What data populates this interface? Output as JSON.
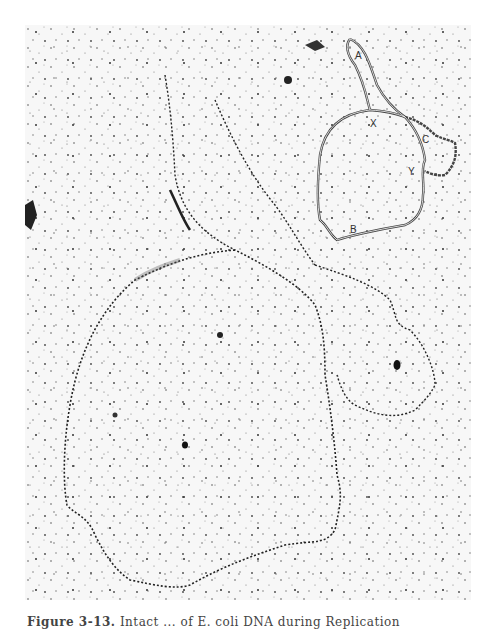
{
  "figure": {
    "caption_number": "Figure 3-13.",
    "caption_text": "Intact ... of E. coli DNA during Replication"
  },
  "inset": {
    "labels": [
      "A",
      "X",
      "C",
      "Y",
      "B"
    ]
  }
}
